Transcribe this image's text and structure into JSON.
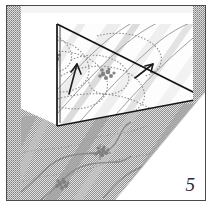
{
  "figure": {
    "kind": "geological-block-diagram",
    "caption_number": "5",
    "frame": {
      "border_color": "#4a4a4a",
      "background": "#ffffff"
    },
    "palette": {
      "ink": "#2b2b2b",
      "outline": "#111111",
      "stipple_dark": "#8d8d8d",
      "stipple_light": "#b9b9b9",
      "band_gray": "#9a9a9a",
      "band_light": "#cfcfcf",
      "contour": "#8a8a8a",
      "paper": "#ffffff"
    },
    "regions": [
      {
        "name": "cut-face-panel",
        "label": "upper triangular cut face",
        "fill": "#fdfdfd"
      },
      {
        "name": "terrain-surface",
        "label": "lower stippled terrain surface",
        "fill": "#d9d9d9"
      },
      {
        "name": "edge-strip-left",
        "label": "left textured margin strip",
        "fill": "#c2c2c2"
      },
      {
        "name": "edge-strip-right",
        "label": "right textured margin strip",
        "fill": "#c2c2c2"
      }
    ],
    "features": [
      {
        "name": "strata-band",
        "count": 6,
        "orientation": "diagonal NE-SW"
      },
      {
        "name": "contour-line",
        "count": 7,
        "style": "stippled curve"
      },
      {
        "name": "outcrop-cluster",
        "count": 4
      },
      {
        "name": "dip-arrow",
        "count": 2
      },
      {
        "name": "drainage-line",
        "count": 3
      }
    ]
  }
}
